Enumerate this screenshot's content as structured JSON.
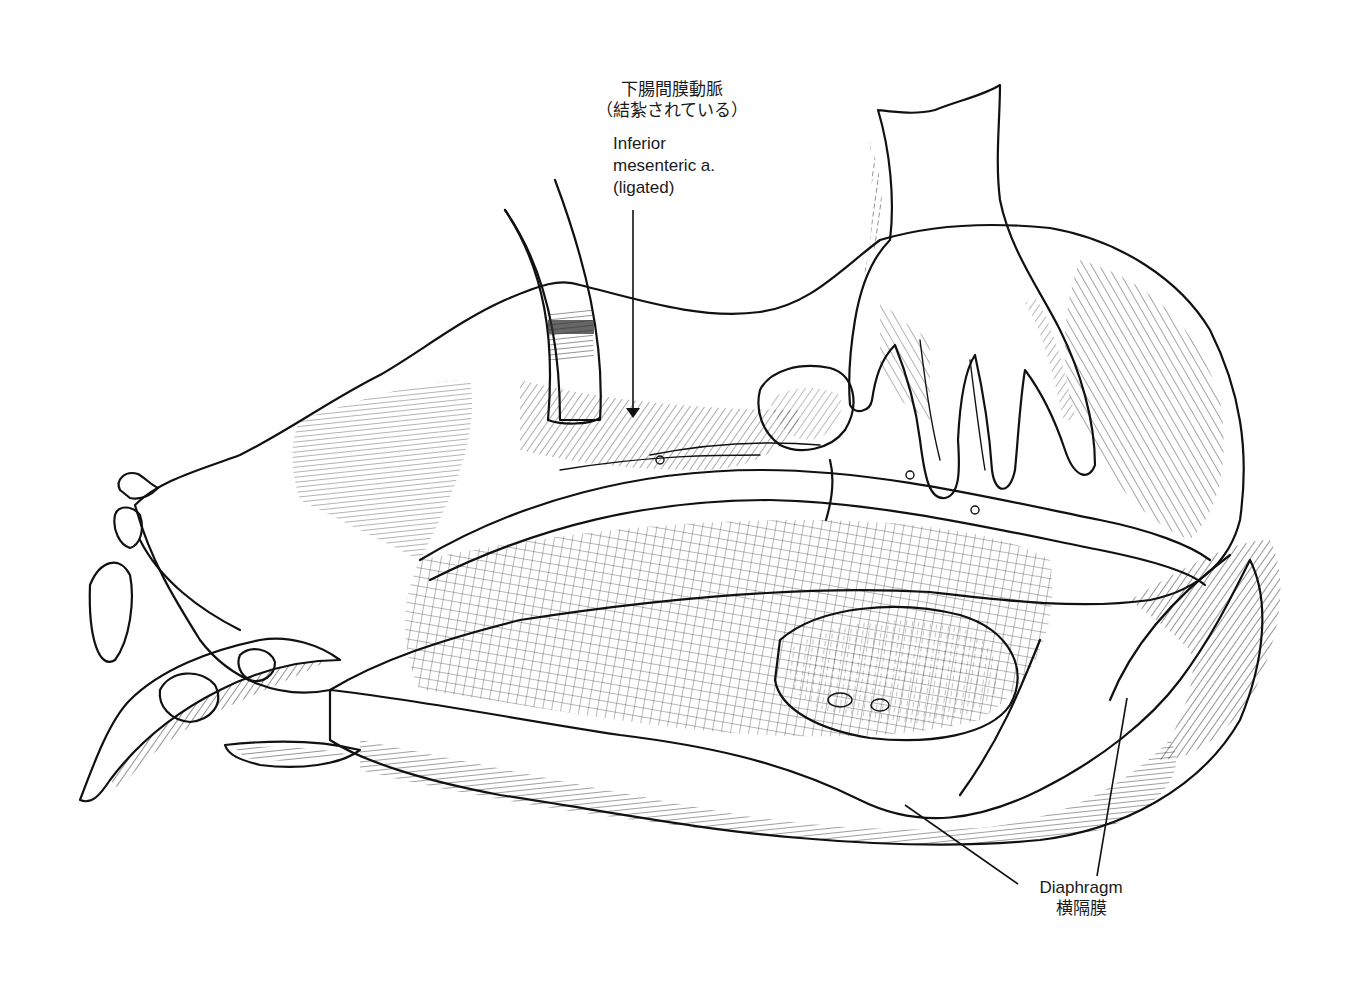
{
  "figure": {
    "type": "anatomical line illustration",
    "style": "black-and-white pen-and-ink hatching",
    "colors": {
      "ink": "#111111",
      "background": "#ffffff"
    }
  },
  "labels": {
    "inferior_mesenteric_artery": {
      "japanese_line1": "下腸間膜動脈",
      "japanese_line2": "（結紮されている）",
      "english_line1": "Inferior",
      "english_line2": "mesenteric a.",
      "english_line3": "(ligated)"
    },
    "diaphragm": {
      "english": "Diaphragm",
      "japanese": "横隔膜"
    }
  },
  "depicted_elements": [
    "hand",
    "retractor",
    "mesentery",
    "ligated inferior mesenteric artery",
    "diaphragm"
  ]
}
